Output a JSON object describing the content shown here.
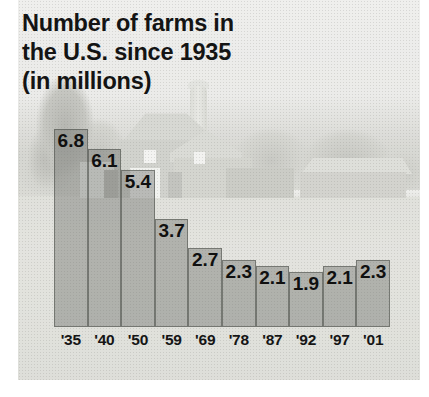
{
  "title": {
    "line1": "Number of farms in",
    "line2": "the U.S. since 1935",
    "line3": "(in millions)"
  },
  "background": {
    "photo_description": "faded black-and-white photograph of a farm with barn, silo and field"
  },
  "chart_data": {
    "type": "bar",
    "title": "Number of farms in the U.S. since 1935 (in millions)",
    "xlabel": "",
    "ylabel": "",
    "ylim": [
      0,
      7.1
    ],
    "grid": false,
    "legend": false,
    "categories": [
      "'35",
      "'40",
      "'50",
      "'59",
      "'69",
      "'78",
      "'87",
      "'92",
      "'97",
      "'01"
    ],
    "values": [
      6.8,
      6.1,
      5.4,
      3.7,
      2.7,
      2.3,
      2.1,
      1.9,
      2.1,
      2.3
    ],
    "value_labels": [
      "6.8",
      "6.1",
      "5.4",
      "3.7",
      "2.7",
      "2.3",
      "2.1",
      "1.9",
      "2.1",
      "2.3"
    ],
    "units": "millions of farms",
    "bar_color": "#6c6e68",
    "label_color": "#101010"
  }
}
